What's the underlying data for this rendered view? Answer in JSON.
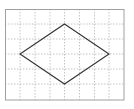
{
  "diagram": {
    "type": "grid-figure",
    "shape": "rhombus",
    "grid": {
      "columns": 8,
      "rows": 6,
      "cell_size_px": 14.8,
      "origin_px": [
        5,
        9
      ],
      "border_color": "#999999",
      "line_color": "#aaaaaa",
      "line_style": "dashed"
    },
    "vertices_grid": {
      "top": [
        4,
        1
      ],
      "right": [
        7,
        3
      ],
      "bottom": [
        4,
        5
      ],
      "left": [
        1,
        3
      ]
    },
    "stroke_color": "#333333"
  }
}
